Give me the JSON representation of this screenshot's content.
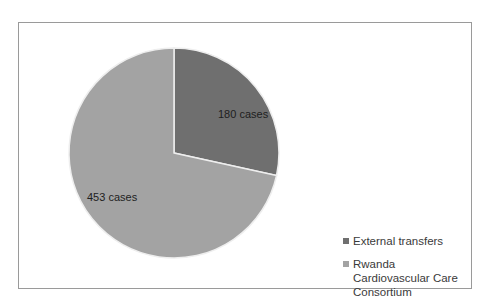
{
  "chart_data": {
    "type": "pie",
    "title": "",
    "categories": [
      "External transfers",
      "Rwanda Cardiovascular Care Consortium"
    ],
    "values": [
      180,
      453
    ],
    "data_labels": [
      "180 cases",
      "453 cases"
    ],
    "colors": [
      "#6f6f6f",
      "#a3a3a3"
    ],
    "legend_position": "right-bottom",
    "start_angle_deg": 0,
    "direction": "clockwise"
  },
  "labels": {
    "slice0": "180 cases",
    "slice1": "453 cases"
  },
  "legend": {
    "items": [
      {
        "label": "External transfers",
        "color": "#6f6f6f"
      },
      {
        "label": "Rwanda Cardiovascular Care Consortium",
        "color": "#a3a3a3"
      }
    ]
  }
}
